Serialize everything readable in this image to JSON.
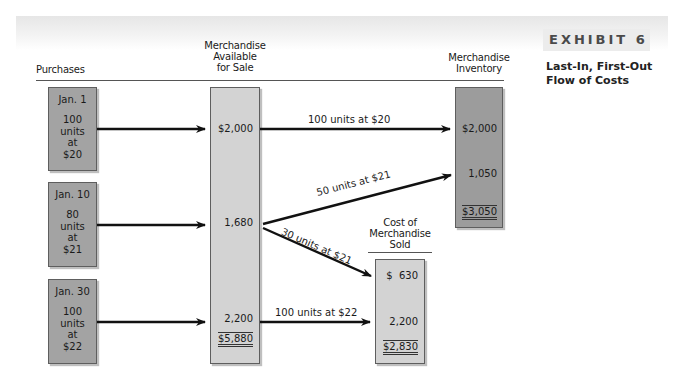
{
  "exhibit": {
    "label": "EXHIBIT 6",
    "title_line1": "Last-In, First-Out",
    "title_line2": "Flow of Costs"
  },
  "columns": {
    "purchases": "Purchases",
    "available_line1": "Merchandise",
    "available_line2": "Available",
    "available_line3": "for Sale",
    "inventory_line1": "Merchandise",
    "inventory_line2": "Inventory",
    "cogs_line1": "Cost of",
    "cogs_line2": "Merchandise",
    "cogs_line3": "Sold"
  },
  "purchases": [
    {
      "date": "Jan. 1",
      "qty": "100",
      "units": "units",
      "at": "at",
      "price": "$20"
    },
    {
      "date": "Jan. 10",
      "qty": "80",
      "units": "units",
      "at": "at",
      "price": "$21"
    },
    {
      "date": "Jan. 30",
      "qty": "100",
      "units": "units",
      "at": "at",
      "price": "$22"
    }
  ],
  "available": {
    "values": [
      "$2,000",
      "1,680",
      "2,200"
    ],
    "total": "$5,880"
  },
  "inventory": {
    "values": [
      "$2,000",
      "1,050"
    ],
    "total": "$3,050"
  },
  "cogs": {
    "values": [
      "$  630",
      "2,200"
    ],
    "total": "$2,830"
  },
  "flows": {
    "to_inventory_1": "100 units at $20",
    "to_inventory_2": "50 units at $21",
    "to_cogs_1": "30 units at $21",
    "to_cogs_2": "100 units at $22"
  },
  "colors": {
    "purchase_box": "#a3a3a3",
    "available_box": "#d3d3d3",
    "inventory_box": "#9c9c9c",
    "cogs_box": "#d3d3d3"
  }
}
